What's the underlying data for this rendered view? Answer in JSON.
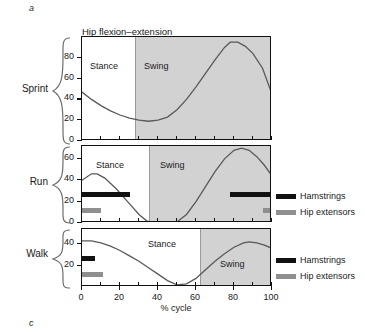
{
  "figure": {
    "panel_letter_top": "a",
    "panel_letter_bottom": "c",
    "title": "Hip flexion–extension",
    "xlabel": "% cycle",
    "conditions": [
      "Sprint",
      "Run",
      "Walk"
    ]
  },
  "legend": {
    "hamstrings_label": "Hamstrings",
    "hip_extensors_label": "Hip extensors",
    "hamstrings_color": "#111111",
    "hip_extensors_color": "#8f8f8f"
  },
  "phases": {
    "stance_label": "Stance",
    "swing_label": "Swing",
    "swing_shade_color": "#d2d2d2"
  },
  "axis": {
    "x_ticks": [
      0,
      20,
      40,
      60,
      80,
      100
    ],
    "x_tick_labels": [
      "0",
      "20",
      "40",
      "60",
      "80",
      "100"
    ],
    "x_min": 0,
    "x_max": 100
  },
  "chart_data": {
    "type": "line",
    "title": "Hip flexion–extension",
    "xlabel": "% cycle",
    "ylabel": "",
    "xlim": [
      0,
      100
    ],
    "grid": false,
    "legend_position": "right",
    "panels": [
      {
        "name": "Sprint",
        "ylim": [
          0,
          100
        ],
        "y_ticks": [
          0,
          20,
          40,
          60,
          80
        ],
        "y_tick_labels": [
          "0",
          "20",
          "40",
          "60",
          "80"
        ],
        "stance_end_pct": 28,
        "stance_label": "Stance",
        "swing_label": "Swing",
        "series": [
          {
            "name": "Hip angle",
            "x": [
              0,
              5,
              10,
              15,
              20,
              25,
              30,
              35,
              40,
              45,
              50,
              55,
              60,
              65,
              70,
              75,
              78,
              82,
              86,
              90,
              95,
              100
            ],
            "values": [
              47,
              40,
              34,
              29,
              25,
              22,
              20,
              19,
              20,
              23,
              30,
              40,
              52,
              65,
              78,
              90,
              95,
              95,
              91,
              84,
              70,
              45
            ]
          }
        ],
        "emg_bars": []
      },
      {
        "name": "Run",
        "ylim": [
          0,
          72
        ],
        "y_ticks": [
          0,
          20,
          40,
          60
        ],
        "y_tick_labels": [
          "0",
          "20",
          "40",
          "60"
        ],
        "stance_end_pct": 35,
        "stance_label": "Stance",
        "swing_label": "Swing",
        "series": [
          {
            "name": "Hip angle",
            "x": [
              0,
              5,
              8,
              12,
              18,
              24,
              30,
              34,
              38,
              42,
              46,
              50,
              55,
              60,
              65,
              70,
              75,
              80,
              84,
              88,
              92,
              96,
              100
            ],
            "values": [
              40,
              46,
              46,
              42,
              32,
              20,
              8,
              2,
              0,
              -2,
              -2,
              1,
              8,
              20,
              34,
              48,
              60,
              68,
              70,
              68,
              62,
              54,
              44
            ]
          }
        ],
        "emg_bars": [
          {
            "muscle": "Hamstrings",
            "start_pct": 0,
            "end_pct": 25,
            "color": "#111111"
          },
          {
            "muscle": "Hamstrings",
            "start_pct": 78,
            "end_pct": 100,
            "color": "#111111"
          },
          {
            "muscle": "Hip extensors",
            "start_pct": 0,
            "end_pct": 10,
            "color": "#8f8f8f"
          },
          {
            "muscle": "Hip extensors",
            "start_pct": 95,
            "end_pct": 100,
            "color": "#8f8f8f"
          }
        ]
      },
      {
        "name": "Walk",
        "ylim": [
          0,
          54
        ],
        "y_ticks": [
          20,
          40
        ],
        "y_tick_labels": [
          "20",
          "40"
        ],
        "stance_end_pct": 62,
        "stance_label": "Stance",
        "swing_label": "Swing",
        "series": [
          {
            "name": "Hip angle",
            "x": [
              0,
              5,
              10,
              15,
              20,
              25,
              30,
              35,
              40,
              45,
              50,
              55,
              60,
              65,
              70,
              75,
              80,
              85,
              88,
              92,
              96,
              100
            ],
            "values": [
              43,
              43,
              41,
              38,
              34,
              29,
              24,
              18,
              12,
              6,
              2,
              3,
              8,
              16,
              24,
              31,
              37,
              41,
              42,
              41,
              39,
              36
            ]
          }
        ],
        "emg_bars": [
          {
            "muscle": "Hamstrings",
            "start_pct": 0,
            "end_pct": 7,
            "color": "#111111"
          },
          {
            "muscle": "Hip extensors",
            "start_pct": 0,
            "end_pct": 11,
            "color": "#8f8f8f"
          }
        ]
      }
    ]
  }
}
